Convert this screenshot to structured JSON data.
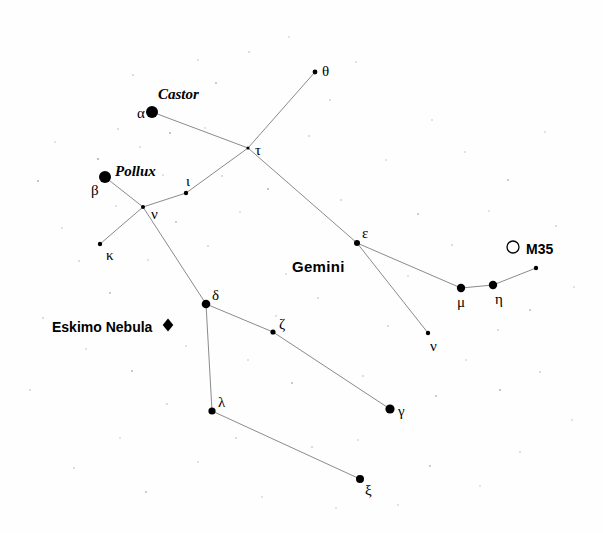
{
  "chart_data": {
    "type": "scatter",
    "title": "Gemini",
    "xlabel": "",
    "ylabel": "",
    "xlim": [
      0,
      603
    ],
    "ylim": [
      0,
      533
    ],
    "grid": false,
    "legend": "none",
    "projection": "star chart",
    "constellation_label": {
      "text": "Gemini",
      "x": 292,
      "y": 266
    },
    "stars": [
      {
        "id": "alpha",
        "label": "α",
        "proper_name": "Castor",
        "x": 152,
        "y": 112,
        "r": 6.0,
        "label_dx": -15,
        "label_dy": 5,
        "name_dx": 6,
        "name_dy": -14
      },
      {
        "id": "beta",
        "label": "β",
        "proper_name": "Pollux",
        "x": 105,
        "y": 177,
        "r": 6.0,
        "label_dx": -14,
        "label_dy": 17,
        "name_dx": 10,
        "name_dy": -2
      },
      {
        "id": "tau",
        "label": "τ",
        "proper_name": "",
        "x": 248,
        "y": 148,
        "r": 1.6,
        "label_dx": 7,
        "label_dy": 6,
        "name_dx": 0,
        "name_dy": 0
      },
      {
        "id": "theta",
        "label": "θ",
        "proper_name": "",
        "x": 315,
        "y": 72,
        "r": 2.4,
        "label_dx": 7,
        "label_dy": 3,
        "name_dx": 0,
        "name_dy": 0
      },
      {
        "id": "iota",
        "label": "ι",
        "proper_name": "",
        "x": 186,
        "y": 193,
        "r": 2.2,
        "label_dx": 0,
        "label_dy": -8,
        "name_dx": 0,
        "name_dy": 0
      },
      {
        "id": "nu_jct",
        "label": "ν",
        "proper_name": "",
        "x": 143,
        "y": 207,
        "r": 2.0,
        "label_dx": 8,
        "label_dy": 11,
        "name_dx": 0,
        "name_dy": 0
      },
      {
        "id": "kappa",
        "label": "κ",
        "proper_name": "",
        "x": 100,
        "y": 244,
        "r": 2.2,
        "label_dx": 6,
        "label_dy": 15,
        "name_dx": 0,
        "name_dy": 0
      },
      {
        "id": "delta",
        "label": "δ",
        "proper_name": "",
        "x": 206,
        "y": 304,
        "r": 4.3,
        "label_dx": 6,
        "label_dy": -5,
        "name_dx": 0,
        "name_dy": 0
      },
      {
        "id": "zeta",
        "label": "ζ",
        "proper_name": "",
        "x": 273,
        "y": 332,
        "r": 2.6,
        "label_dx": 6,
        "label_dy": -4,
        "name_dx": 0,
        "name_dy": 0
      },
      {
        "id": "lambda",
        "label": "λ",
        "proper_name": "",
        "x": 212,
        "y": 411,
        "r": 3.6,
        "label_dx": 6,
        "label_dy": -5,
        "name_dx": 0,
        "name_dy": 0
      },
      {
        "id": "gamma",
        "label": "γ",
        "proper_name": "",
        "x": 390,
        "y": 409,
        "r": 4.6,
        "label_dx": 8,
        "label_dy": 6,
        "name_dx": 0,
        "name_dy": 0
      },
      {
        "id": "xi",
        "label": "ξ",
        "proper_name": "",
        "x": 360,
        "y": 479,
        "r": 4.0,
        "label_dx": 5,
        "label_dy": 15,
        "name_dx": 0,
        "name_dy": 0
      },
      {
        "id": "epsilon",
        "label": "ε",
        "proper_name": "",
        "x": 357,
        "y": 243,
        "r": 3.0,
        "label_dx": 5,
        "label_dy": -6,
        "name_dx": 0,
        "name_dy": 0
      },
      {
        "id": "mu",
        "label": "μ",
        "proper_name": "",
        "x": 461,
        "y": 288,
        "r": 4.2,
        "label_dx": -4,
        "label_dy": 18,
        "name_dx": 0,
        "name_dy": 0
      },
      {
        "id": "eta",
        "label": "η",
        "proper_name": "",
        "x": 493,
        "y": 285,
        "r": 4.2,
        "label_dx": 2,
        "label_dy": 18,
        "name_dx": 0,
        "name_dy": 0
      },
      {
        "id": "nu_low",
        "label": "ν",
        "proper_name": "",
        "x": 428,
        "y": 333,
        "r": 2.2,
        "label_dx": 2,
        "label_dy": 17,
        "name_dx": 0,
        "name_dy": 0
      },
      {
        "id": "unlabeled_1",
        "label": "",
        "proper_name": "",
        "x": 536,
        "y": 268,
        "r": 2.2,
        "label_dx": 0,
        "label_dy": 0,
        "name_dx": 0,
        "name_dy": 0
      }
    ],
    "constellation_lines": [
      [
        "alpha",
        "tau"
      ],
      [
        "tau",
        "theta"
      ],
      [
        "tau",
        "iota"
      ],
      [
        "iota",
        "nu_jct"
      ],
      [
        "nu_jct",
        "beta"
      ],
      [
        "nu_jct",
        "kappa"
      ],
      [
        "nu_jct",
        "delta"
      ],
      [
        "delta",
        "lambda"
      ],
      [
        "delta",
        "zeta"
      ],
      [
        "zeta",
        "gamma"
      ],
      [
        "lambda",
        "xi"
      ],
      [
        "tau",
        "epsilon"
      ],
      [
        "epsilon",
        "mu"
      ],
      [
        "mu",
        "eta"
      ],
      [
        "eta",
        "unlabeled_1"
      ],
      [
        "epsilon",
        "nu_low"
      ]
    ],
    "deep_sky_objects": [
      {
        "id": "m35",
        "label": "M35",
        "marker": "open-circle",
        "x": 513,
        "y": 247,
        "r": 6.0,
        "label_dx": 13,
        "label_dy": 6
      },
      {
        "id": "eskimo_nebula",
        "label": "Eskimo Nebula",
        "marker": "filled-diamond",
        "x": 168,
        "y": 325,
        "r": 6.5,
        "label_dx": -116,
        "label_dy": 6
      }
    ],
    "background_stars": [
      {
        "x": 38,
        "y": 181,
        "r": 1.0
      },
      {
        "x": 98,
        "y": 159,
        "r": 1.1
      },
      {
        "x": 118,
        "y": 129,
        "r": 0.8
      },
      {
        "x": 140,
        "y": 147,
        "r": 0.7
      },
      {
        "x": 170,
        "y": 133,
        "r": 1.0
      },
      {
        "x": 175,
        "y": 96,
        "r": 0.9
      },
      {
        "x": 133,
        "y": 75,
        "r": 0.8
      },
      {
        "x": 198,
        "y": 60,
        "r": 0.7
      },
      {
        "x": 216,
        "y": 83,
        "r": 0.9
      },
      {
        "x": 249,
        "y": 52,
        "r": 0.8
      },
      {
        "x": 289,
        "y": 37,
        "r": 0.7
      },
      {
        "x": 330,
        "y": 100,
        "r": 0.8
      },
      {
        "x": 356,
        "y": 62,
        "r": 0.7
      },
      {
        "x": 309,
        "y": 136,
        "r": 0.8
      },
      {
        "x": 268,
        "y": 189,
        "r": 1.0
      },
      {
        "x": 222,
        "y": 176,
        "r": 0.8
      },
      {
        "x": 176,
        "y": 222,
        "r": 0.9
      },
      {
        "x": 208,
        "y": 246,
        "r": 0.8
      },
      {
        "x": 148,
        "y": 260,
        "r": 0.7
      },
      {
        "x": 110,
        "y": 293,
        "r": 0.9
      },
      {
        "x": 79,
        "y": 261,
        "r": 0.8
      },
      {
        "x": 62,
        "y": 228,
        "r": 0.7
      },
      {
        "x": 43,
        "y": 318,
        "r": 0.8
      },
      {
        "x": 86,
        "y": 349,
        "r": 0.7
      },
      {
        "x": 132,
        "y": 371,
        "r": 0.9
      },
      {
        "x": 167,
        "y": 404,
        "r": 0.8
      },
      {
        "x": 120,
        "y": 438,
        "r": 0.7
      },
      {
        "x": 74,
        "y": 468,
        "r": 0.8
      },
      {
        "x": 146,
        "y": 492,
        "r": 0.9
      },
      {
        "x": 198,
        "y": 462,
        "r": 0.7
      },
      {
        "x": 236,
        "y": 438,
        "r": 0.8
      },
      {
        "x": 262,
        "y": 497,
        "r": 0.7
      },
      {
        "x": 312,
        "y": 447,
        "r": 0.8
      },
      {
        "x": 336,
        "y": 508,
        "r": 0.7
      },
      {
        "x": 292,
        "y": 383,
        "r": 0.9
      },
      {
        "x": 248,
        "y": 360,
        "r": 0.7
      },
      {
        "x": 318,
        "y": 298,
        "r": 0.8
      },
      {
        "x": 286,
        "y": 274,
        "r": 0.7
      },
      {
        "x": 341,
        "y": 200,
        "r": 0.8
      },
      {
        "x": 386,
        "y": 160,
        "r": 0.7
      },
      {
        "x": 418,
        "y": 214,
        "r": 0.9
      },
      {
        "x": 452,
        "y": 245,
        "r": 0.8
      },
      {
        "x": 489,
        "y": 211,
        "r": 0.7
      },
      {
        "x": 508,
        "y": 180,
        "r": 0.9
      },
      {
        "x": 556,
        "y": 226,
        "r": 0.8
      },
      {
        "x": 574,
        "y": 287,
        "r": 0.7
      },
      {
        "x": 530,
        "y": 310,
        "r": 0.9
      },
      {
        "x": 498,
        "y": 330,
        "r": 0.8
      },
      {
        "x": 466,
        "y": 360,
        "r": 0.7
      },
      {
        "x": 436,
        "y": 396,
        "r": 0.9
      },
      {
        "x": 500,
        "y": 390,
        "r": 1.0
      },
      {
        "x": 540,
        "y": 372,
        "r": 0.8
      },
      {
        "x": 572,
        "y": 420,
        "r": 0.7
      },
      {
        "x": 520,
        "y": 452,
        "r": 0.8
      },
      {
        "x": 480,
        "y": 486,
        "r": 0.7
      },
      {
        "x": 430,
        "y": 466,
        "r": 0.9
      },
      {
        "x": 398,
        "y": 505,
        "r": 0.7
      },
      {
        "x": 388,
        "y": 326,
        "r": 0.8
      },
      {
        "x": 408,
        "y": 276,
        "r": 0.7
      },
      {
        "x": 363,
        "y": 376,
        "r": 0.8
      },
      {
        "x": 55,
        "y": 142,
        "r": 0.7
      },
      {
        "x": 30,
        "y": 390,
        "r": 0.8
      },
      {
        "x": 205,
        "y": 128,
        "r": 0.7
      },
      {
        "x": 240,
        "y": 212,
        "r": 0.7
      },
      {
        "x": 163,
        "y": 175,
        "r": 0.7
      },
      {
        "x": 116,
        "y": 206,
        "r": 0.7
      },
      {
        "x": 465,
        "y": 152,
        "r": 0.7
      },
      {
        "x": 432,
        "y": 120,
        "r": 0.7
      },
      {
        "x": 545,
        "y": 132,
        "r": 0.7
      },
      {
        "x": 358,
        "y": 440,
        "r": 0.7
      },
      {
        "x": 276,
        "y": 316,
        "r": 0.7
      },
      {
        "x": 186,
        "y": 346,
        "r": 0.7
      }
    ]
  },
  "colors": {
    "background": "#fefefe",
    "star": "#000000",
    "line": "#8a8a8a",
    "text": "#000000"
  }
}
